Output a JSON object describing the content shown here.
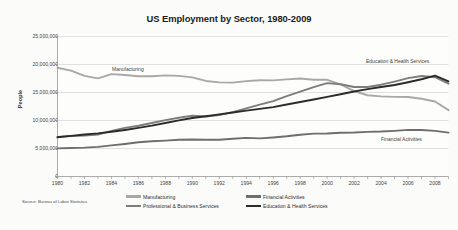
{
  "chart_data": {
    "type": "line",
    "title": "US Employment by Sector, 1980-2009",
    "xlabel": "",
    "ylabel": "People",
    "xlim": [
      1980,
      2009
    ],
    "ylim": [
      0,
      25000000
    ],
    "grid": true,
    "legend_position": "bottom",
    "source": "Source: Bureau of Labor Statistics",
    "y_ticks": [
      "0",
      "5,000,000",
      "10,000,000",
      "15,000,000",
      "20,000,000",
      "25,000,000"
    ],
    "y_tick_values": [
      0,
      5000000,
      10000000,
      15000000,
      20000000,
      25000000
    ],
    "x_ticks": [
      "1980",
      "1982",
      "1984",
      "1986",
      "1988",
      "1990",
      "1992",
      "1994",
      "1996",
      "1998",
      "2000",
      "2002",
      "2004",
      "2006",
      "2008"
    ],
    "x": [
      1980,
      1981,
      1982,
      1983,
      1984,
      1985,
      1986,
      1987,
      1988,
      1989,
      1990,
      1991,
      1992,
      1993,
      1994,
      1995,
      1996,
      1997,
      1998,
      1999,
      2000,
      2001,
      2002,
      2003,
      2004,
      2005,
      2006,
      2007,
      2008,
      2009
    ],
    "series": [
      {
        "name": "Manufacturing",
        "color": "#a8a8a8",
        "values": [
          19426000,
          18907000,
          17961000,
          17527000,
          18283000,
          18115000,
          17891000,
          17894000,
          18056000,
          17970000,
          17702000,
          17064000,
          16803000,
          16772000,
          17024000,
          17180000,
          17174000,
          17345000,
          17506000,
          17272000,
          17266000,
          16434000,
          15256000,
          14508000,
          14314000,
          14223000,
          14190000,
          13880000,
          13396000,
          11847000
        ],
        "inline_label": "Manufacturing"
      },
      {
        "name": "Financial Activities",
        "color": "#6e6e6e",
        "values": [
          5025000,
          5082000,
          5154000,
          5283000,
          5553000,
          5815000,
          6110000,
          6297000,
          6409000,
          6557000,
          6614000,
          6561000,
          6559000,
          6742000,
          6896000,
          6807000,
          6969000,
          7178000,
          7462000,
          7648000,
          7687000,
          7808000,
          7847000,
          7977000,
          8031000,
          8153000,
          8328000,
          8301000,
          8145000,
          7840000
        ]
      },
      {
        "name": "Professional & Business Services",
        "color": "#7d7d7d",
        "values": [
          7077000,
          7229000,
          7294000,
          7477000,
          8146000,
          8679000,
          9061000,
          9563000,
          10055000,
          10492000,
          10848000,
          10713000,
          10970000,
          11495000,
          12174000,
          12844000,
          13462000,
          14335000,
          15147000,
          15957000,
          16666000,
          16476000,
          15976000,
          15987000,
          16394000,
          16954000,
          17566000,
          17942000,
          17735000,
          16579000
        ]
      },
      {
        "name": "Education & Health Services",
        "color": "#2b2b2b",
        "values": [
          7000000,
          7258000,
          7496000,
          7701000,
          7980000,
          8314000,
          8679000,
          9086000,
          9562000,
          10025000,
          10442000,
          10770000,
          11092000,
          11434000,
          11764000,
          12071000,
          12398000,
          12858000,
          13311000,
          13751000,
          14215000,
          14688000,
          15170000,
          15606000,
          15984000,
          16341000,
          16829000,
          17370000,
          18011000,
          17005000
        ],
        "inline_label": "Education & Health Services"
      }
    ]
  },
  "annotations": {
    "manufacturing": "Manufacturing",
    "education": "Education & Health Services",
    "financial": "Financial Activities"
  },
  "legend": {
    "items": [
      {
        "label": "Manufacturing",
        "color": "#a8a8a8"
      },
      {
        "label": "Professional & Business Services",
        "color": "#7d7d7d"
      },
      {
        "label": "Financial Activities",
        "color": "#6e6e6e"
      },
      {
        "label": "Education & Health Services",
        "color": "#2b2b2b"
      }
    ]
  }
}
